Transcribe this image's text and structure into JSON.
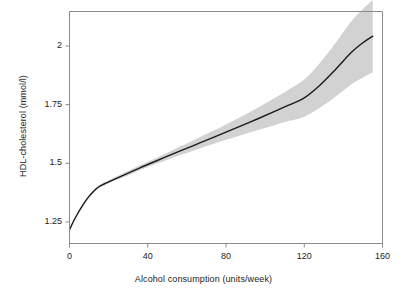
{
  "chart_data": {
    "type": "line",
    "title": "",
    "subtitle": "",
    "xlabel": "Alcohol consumption (units/week)",
    "ylabel": "HDL-cholesterol (mmol/l)",
    "xlim": [
      0,
      160
    ],
    "ylim": [
      1.18,
      2.12
    ],
    "xticks": [
      0,
      40,
      80,
      120,
      160
    ],
    "xticklabels": [
      "0",
      "40",
      "80",
      "120",
      "160"
    ],
    "yticks": [
      1.25,
      1.5,
      1.75,
      2
    ],
    "yticklabels": [
      "1.25",
      "1.5",
      "1.75",
      "2"
    ],
    "grid": false,
    "legend": null,
    "annotations": [],
    "series": [
      {
        "name": "HDL-cholesterol fitted spline",
        "style": "solid-line",
        "color": "#1a1a1a",
        "x": [
          0,
          2,
          4,
          6,
          8,
          10,
          12,
          14,
          16,
          18,
          20,
          24,
          28,
          32,
          36,
          40,
          48,
          56,
          64,
          72,
          80,
          88,
          96,
          104,
          112,
          120,
          128,
          136,
          144,
          150,
          155
        ],
        "y": [
          1.217,
          1.252,
          1.283,
          1.311,
          1.337,
          1.359,
          1.378,
          1.394,
          1.405,
          1.413,
          1.421,
          1.436,
          1.451,
          1.466,
          1.481,
          1.495,
          1.523,
          1.551,
          1.578,
          1.605,
          1.633,
          1.661,
          1.689,
          1.718,
          1.748,
          1.779,
          1.833,
          1.9,
          1.972,
          2.014,
          2.042
        ]
      },
      {
        "name": "95% confidence band",
        "style": "shaded-band",
        "color": "#d2d2d2",
        "x": [
          0,
          2,
          4,
          6,
          8,
          10,
          12,
          14,
          16,
          18,
          20,
          24,
          28,
          32,
          36,
          40,
          48,
          56,
          64,
          72,
          80,
          88,
          96,
          104,
          112,
          120,
          128,
          136,
          144,
          150,
          155
        ],
        "lower": [
          1.213,
          1.248,
          1.279,
          1.307,
          1.333,
          1.355,
          1.374,
          1.389,
          1.4,
          1.408,
          1.415,
          1.429,
          1.443,
          1.457,
          1.471,
          1.484,
          1.509,
          1.533,
          1.556,
          1.578,
          1.6,
          1.621,
          1.641,
          1.66,
          1.68,
          1.699,
          1.737,
          1.784,
          1.836,
          1.866,
          1.888
        ],
        "upper": [
          1.221,
          1.257,
          1.288,
          1.316,
          1.342,
          1.364,
          1.383,
          1.399,
          1.411,
          1.419,
          1.428,
          1.444,
          1.46,
          1.476,
          1.492,
          1.507,
          1.538,
          1.57,
          1.601,
          1.633,
          1.666,
          1.7,
          1.736,
          1.774,
          1.814,
          1.857,
          1.928,
          2.013,
          2.104,
          2.158,
          2.196
        ]
      }
    ]
  },
  "figure": {
    "background_color": "#ffffff",
    "frame_color": "#808080",
    "line_color": "#1a1a1a",
    "band_color": "#d2d2d2",
    "text_color": "#1d1d1d"
  }
}
